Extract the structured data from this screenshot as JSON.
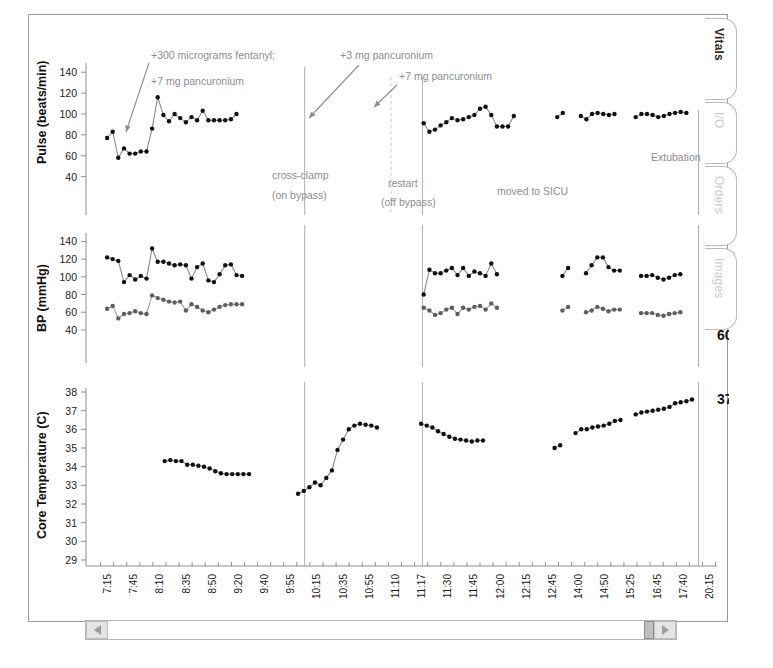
{
  "window": {
    "title": "Vitals"
  },
  "tabs": [
    {
      "label": "Vitals",
      "active": true
    },
    {
      "label": "I/O",
      "active": false
    },
    {
      "label": "Orders",
      "active": false
    },
    {
      "label": "Images",
      "active": false
    }
  ],
  "scrollbar": {
    "left_arrow": "◀",
    "right_arrow": "▶",
    "thumb_position": "right"
  },
  "events": [
    {
      "name": "cross-clamp",
      "line1": "cross-clamp",
      "line2": "(on bypass)",
      "x_index": 7,
      "style": "solid"
    },
    {
      "name": "restart",
      "line1": "restart",
      "line2": "(off bypass)",
      "x_index": 12,
      "style": "solid"
    },
    {
      "name": "off-bypass-marker",
      "line1": "",
      "line2": "",
      "x_index": 10.6,
      "style": "dashed"
    },
    {
      "name": "extubation",
      "line1": "Extubation",
      "line2": "",
      "x_index": 23,
      "style": "solid"
    }
  ],
  "annotations": [
    {
      "name": "fentanyl-pancuronium",
      "line1": "+300 micrograms fentanyl;",
      "line2": "+7 mg pancuronium"
    },
    {
      "name": "pancuronium-3mg",
      "line1": "+3 mg pancuronium",
      "line2": ""
    },
    {
      "name": "pancuronium-7mg",
      "line1": "+7 mg pancuronium",
      "line2": ""
    },
    {
      "name": "moved-to-sicu",
      "line1": "moved to SICU",
      "line2": ""
    }
  ],
  "chart_data": [
    {
      "name": "pulse",
      "type": "line",
      "title": "",
      "ylabel": "Pulse (beats/min)",
      "xlabel": "",
      "ylim": [
        30,
        145
      ],
      "yticks": [
        40,
        60,
        80,
        100,
        120,
        140
      ],
      "grid": false,
      "end_value_label": "101",
      "x": [
        "7:15",
        "7:45",
        "8:10",
        "8:35",
        "8:50",
        "9:20",
        "9:40",
        "9:55",
        "10:15",
        "10:35",
        "10:55",
        "11:10",
        "11:17",
        "11:30",
        "11:45",
        "12:00",
        "12:15",
        "12:45",
        "14:00",
        "14:50",
        "15:25",
        "16:45",
        "17:40",
        "20:15"
      ],
      "series": [
        {
          "name": "Pulse",
          "color": "#111111",
          "segments": [
            {
              "start_index": 0.0,
              "values": [
                77,
                83,
                58,
                67,
                62,
                62,
                64,
                64,
                86,
                116,
                99,
                93,
                100,
                96,
                92,
                97,
                94,
                103,
                94,
                94,
                94,
                94,
                95,
                100
              ]
            },
            {
              "start_index": 12.1,
              "values": [
                91,
                83,
                85,
                89,
                92,
                96,
                94,
                95,
                97,
                99,
                105,
                107,
                99,
                88,
                88,
                88,
                98
              ]
            },
            {
              "start_index": 17.2,
              "values": [
                97,
                101
              ]
            },
            {
              "start_index": 18.1,
              "values": [
                98,
                95,
                100,
                101,
                100,
                99,
                100
              ]
            },
            {
              "start_index": 20.2,
              "values": [
                97,
                100,
                100,
                99,
                97,
                98,
                100,
                101,
                102,
                101
              ]
            }
          ]
        }
      ]
    },
    {
      "name": "blood-pressure",
      "type": "line",
      "title": "",
      "ylabel": "BP (mmHg)",
      "xlabel": "",
      "ylim": [
        32,
        145
      ],
      "yticks": [
        40,
        60,
        80,
        100,
        120,
        140
      ],
      "grid": false,
      "end_value_labels": [
        "101",
        "60"
      ],
      "x": [
        "7:15",
        "7:45",
        "8:10",
        "8:35",
        "8:50",
        "9:20",
        "9:40",
        "9:55",
        "10:15",
        "10:35",
        "10:55",
        "11:10",
        "11:17",
        "11:30",
        "11:45",
        "12:00",
        "12:15",
        "12:45",
        "14:00",
        "14:50",
        "15:25",
        "16:45",
        "17:40",
        "20:15"
      ],
      "series": [
        {
          "name": "Systolic",
          "color": "#111111",
          "segments": [
            {
              "start_index": 0.0,
              "values": [
                122,
                120,
                118,
                94,
                102,
                97,
                101,
                98,
                132,
                117,
                117,
                115,
                113,
                114,
                113,
                98,
                111,
                115,
                96,
                94,
                103,
                113,
                114,
                102,
                101
              ]
            },
            {
              "start_index": 12.1,
              "values": [
                80,
                108,
                104,
                104,
                107,
                110,
                102,
                110,
                101,
                106,
                104,
                101,
                115,
                103
              ]
            },
            {
              "start_index": 17.4,
              "values": [
                101,
                110
              ]
            },
            {
              "start_index": 18.3,
              "values": [
                104,
                113,
                122,
                122,
                111,
                107,
                107
              ]
            },
            {
              "start_index": 20.4,
              "values": [
                101,
                101,
                102,
                99,
                97,
                99,
                102,
                103
              ]
            }
          ]
        },
        {
          "name": "Diastolic",
          "color": "#5e5e5e",
          "segments": [
            {
              "start_index": 0.0,
              "values": [
                64,
                67,
                53,
                58,
                59,
                61,
                59,
                58,
                79,
                76,
                74,
                72,
                71,
                72,
                62,
                69,
                66,
                62,
                60,
                63,
                66,
                68,
                69,
                69,
                69
              ]
            },
            {
              "start_index": 12.1,
              "values": [
                65,
                62,
                57,
                59,
                63,
                65,
                58,
                65,
                63,
                66,
                67,
                63,
                70,
                65
              ]
            },
            {
              "start_index": 17.4,
              "values": [
                62,
                66
              ]
            },
            {
              "start_index": 18.3,
              "values": [
                60,
                62,
                66,
                64,
                61,
                63,
                63
              ]
            },
            {
              "start_index": 20.4,
              "values": [
                59,
                59,
                59,
                57,
                56,
                58,
                59,
                60
              ]
            }
          ]
        }
      ]
    },
    {
      "name": "core-temperature",
      "type": "line",
      "title": "",
      "ylabel": "Core Temperature (C)",
      "xlabel": "",
      "ylim": [
        29,
        38
      ],
      "yticks": [
        29,
        30,
        31,
        32,
        33,
        34,
        35,
        36,
        37,
        38
      ],
      "grid": false,
      "end_value_label": "37.6",
      "x": [
        "7:15",
        "7:45",
        "8:10",
        "8:35",
        "8:50",
        "9:20",
        "9:40",
        "9:55",
        "10:15",
        "10:35",
        "10:55",
        "11:10",
        "11:17",
        "11:30",
        "11:45",
        "12:00",
        "12:15",
        "12:45",
        "14:00",
        "14:50",
        "15:25",
        "16:45",
        "17:40",
        "20:15"
      ],
      "series": [
        {
          "name": "Core Temperature",
          "color": "#111111",
          "segments": [
            {
              "start_index": 2.2,
              "values": [
                34.3,
                34.35,
                34.3,
                34.3,
                34.1,
                34.1,
                34.05,
                34.0,
                33.9,
                33.75,
                33.65,
                33.6,
                33.6,
                33.6,
                33.6,
                33.6
              ]
            },
            {
              "start_index": 7.3,
              "values": [
                32.55,
                32.7,
                32.9,
                33.15,
                33.0,
                33.4,
                33.8,
                34.9,
                35.45,
                36.0,
                36.2,
                36.3,
                36.25,
                36.2,
                36.1
              ]
            },
            {
              "start_index": 12.0,
              "values": [
                36.3,
                36.2,
                36.1,
                35.9,
                35.75,
                35.6,
                35.5,
                35.45,
                35.4,
                35.35,
                35.4,
                35.4
              ]
            },
            {
              "start_index": 17.1,
              "values": [
                35.0,
                35.15
              ]
            },
            {
              "start_index": 17.9,
              "values": [
                35.8,
                36.0,
                36.0,
                36.1,
                36.15,
                36.2,
                36.3,
                36.45,
                36.5
              ]
            },
            {
              "start_index": 20.2,
              "values": [
                36.8,
                36.9,
                36.95,
                37.0,
                37.05,
                37.1,
                37.2,
                37.4,
                37.45,
                37.5,
                37.6
              ]
            }
          ]
        }
      ]
    }
  ]
}
